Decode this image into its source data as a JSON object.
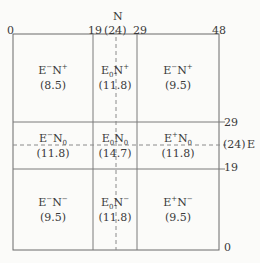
{
  "axes": {
    "n_label": "N",
    "e_label": "E",
    "top_ticks": [
      "0",
      "19",
      "(24)",
      "29",
      "48"
    ],
    "right_ticks": [
      "29",
      "(24)",
      "19",
      "0"
    ]
  },
  "cells": [
    {
      "e": "E",
      "e_sup": "−",
      "e_sub": "",
      "n": "N",
      "n_sup": "+",
      "n_sub": "",
      "value": "(8.5)"
    },
    {
      "e": "E",
      "e_sup": "",
      "e_sub": "0",
      "n": "N",
      "n_sup": "+",
      "n_sub": "",
      "value": "(11.8)"
    },
    {
      "e": "E",
      "e_sup": "−",
      "e_sub": "",
      "n": "N",
      "n_sup": "+",
      "n_sub": "",
      "value": "(9.5)"
    },
    {
      "e": "E",
      "e_sup": "−",
      "e_sub": "",
      "n": "N",
      "n_sup": "",
      "n_sub": "0",
      "value": "(11.8)"
    },
    {
      "e": "E",
      "e_sup": "",
      "e_sub": "0",
      "n": "N",
      "n_sup": "",
      "n_sub": "0",
      "value": "(14.7)"
    },
    {
      "e": "E",
      "e_sup": "+",
      "e_sub": "",
      "n": "N",
      "n_sup": "",
      "n_sub": "0",
      "value": "(11.8)"
    },
    {
      "e": "E",
      "e_sup": "−",
      "e_sub": "",
      "n": "N",
      "n_sup": "−",
      "n_sub": "",
      "value": "(9.5)"
    },
    {
      "e": "E",
      "e_sup": "",
      "e_sub": "0",
      "n": "N",
      "n_sup": "−",
      "n_sub": "",
      "value": "(11.8)"
    },
    {
      "e": "E",
      "e_sup": "+",
      "e_sub": "",
      "n": "N",
      "n_sup": "−",
      "n_sub": "",
      "value": "(9.5)"
    }
  ]
}
